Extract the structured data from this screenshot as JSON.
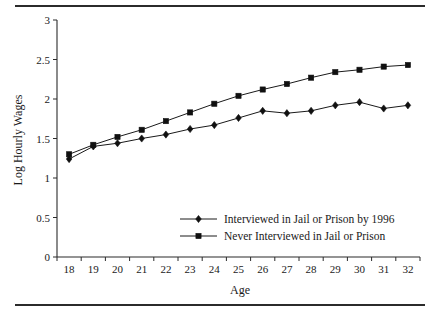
{
  "figure": {
    "has_top_rule": true,
    "has_bottom_rule": true,
    "rule_color": "#2b2b2b"
  },
  "chart_data": {
    "type": "line",
    "title": "",
    "xlabel": "Age",
    "ylabel": "Log Hourly Wages",
    "x": [
      18,
      19,
      20,
      21,
      22,
      23,
      24,
      25,
      26,
      27,
      28,
      29,
      30,
      31,
      32
    ],
    "xtick_labels": [
      "18",
      "19",
      "20",
      "21",
      "22",
      "23",
      "24",
      "25",
      "26",
      "27",
      "28",
      "29",
      "30",
      "31",
      "32"
    ],
    "ytick_labels": [
      "0",
      "0.5",
      "1",
      "1.5",
      "2",
      "2.5",
      "3"
    ],
    "yticks": [
      0,
      0.5,
      1,
      1.5,
      2,
      2.5,
      3
    ],
    "ylim": [
      0,
      3
    ],
    "xlim": [
      17.5,
      32.5
    ],
    "grid": false,
    "legend_position": "lower right",
    "series": [
      {
        "name": "Interviewed in Jail or Prison by 1996",
        "marker": "diamond",
        "color": "#101010",
        "values": [
          1.24,
          1.4,
          1.44,
          1.5,
          1.55,
          1.62,
          1.67,
          1.76,
          1.85,
          1.82,
          1.85,
          1.92,
          1.96,
          1.88,
          1.92
        ]
      },
      {
        "name": "Never Interviewed in Jail or Prison",
        "marker": "square",
        "color": "#101010",
        "values": [
          1.3,
          1.42,
          1.52,
          1.61,
          1.72,
          1.83,
          1.94,
          2.04,
          2.12,
          2.19,
          2.27,
          2.34,
          2.37,
          2.41,
          2.43
        ]
      }
    ]
  }
}
